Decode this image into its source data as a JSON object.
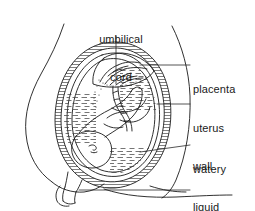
{
  "diagram": {
    "background_color": "#ffffff",
    "ink_color": "#1a1a1a",
    "labels": [
      {
        "id": "umbilical-cord",
        "line1": "umbilical",
        "line2": "cord",
        "position": "top-center"
      },
      {
        "id": "placenta",
        "line1": "placenta",
        "line2": "",
        "position": "right"
      },
      {
        "id": "uterus-wall",
        "line1": "uterus",
        "line2": "wall",
        "position": "right"
      },
      {
        "id": "watery-liquid",
        "line1": "watery",
        "line2": "liquid",
        "position": "right"
      },
      {
        "id": "vagina",
        "line1": "vagina",
        "line2": "",
        "position": "right"
      }
    ],
    "structures": [
      "maternal-body-outline",
      "uterus-wall",
      "amniotic-sac",
      "amniotic-fluid",
      "placenta",
      "umbilical-cord",
      "fetus",
      "cervix",
      "vagina"
    ]
  }
}
